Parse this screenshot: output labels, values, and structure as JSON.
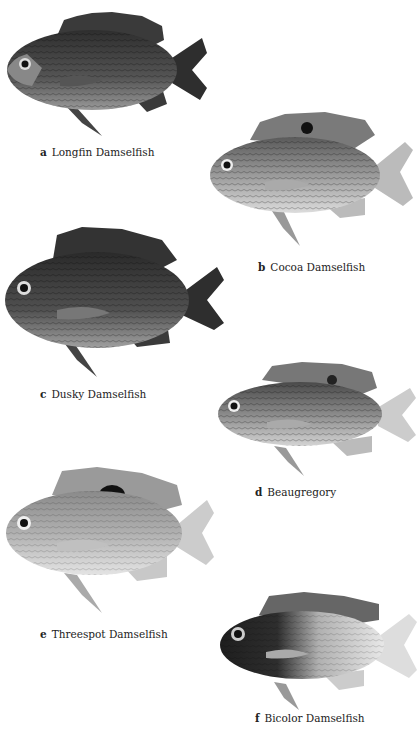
{
  "plate": {
    "fish": [
      {
        "letter": "a",
        "name": "Longfin Damselfish",
        "tone": "dark",
        "body_color": "#3a3a3a",
        "belly_color": "#9a9a9a"
      },
      {
        "letter": "b",
        "name": "Cocoa Damselfish",
        "tone": "light",
        "body_color": "#8a8a8a",
        "belly_color": "#d8d8d8",
        "spot": true
      },
      {
        "letter": "c",
        "name": "Dusky Damselfish",
        "tone": "dark",
        "body_color": "#333333",
        "belly_color": "#9a9a9a"
      },
      {
        "letter": "d",
        "name": "Beaugregory",
        "tone": "light",
        "body_color": "#707070",
        "belly_color": "#d0d0d0",
        "spot": true
      },
      {
        "letter": "e",
        "name": "Threespot Damselfish",
        "tone": "pale",
        "body_color": "#a8a8a8",
        "belly_color": "#e2e2e2",
        "spot": true
      },
      {
        "letter": "f",
        "name": "Bicolor Damselfish",
        "tone": "bicolor",
        "body_color": "#2a2a2a",
        "belly_color": "#e4e4e4"
      }
    ]
  }
}
